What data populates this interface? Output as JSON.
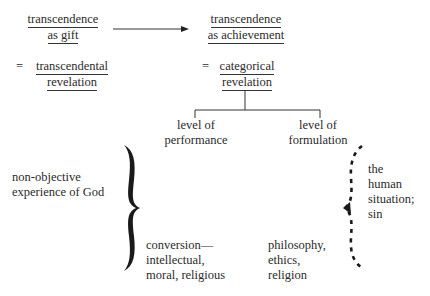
{
  "left_top": {
    "line1": "transcendence",
    "line2": "as gift"
  },
  "right_top": {
    "line1": "transcendence",
    "line2": "as achievement"
  },
  "left_eq": {
    "eq": "=",
    "line1": "transcendental",
    "line2": "revelation"
  },
  "right_eq": {
    "eq": "=",
    "line1": "categorical",
    "line2": "revelation"
  },
  "branches": {
    "performance": {
      "line1": "level of",
      "line2": "performance"
    },
    "formulation": {
      "line1": "level of",
      "line2": "formulation"
    }
  },
  "left_label": {
    "line1": "non-objective",
    "line2": "experience of God"
  },
  "bottom_performance": {
    "line1": "conversion—",
    "line2": "intellectual,",
    "line3": "moral, religious"
  },
  "bottom_formulation": {
    "line1": "philosophy,",
    "line2": "ethics,",
    "line3": "religion"
  },
  "right_label": {
    "line1": "the",
    "line2": "human",
    "line3": "situation;",
    "line4": "sin"
  },
  "colors": {
    "ink": "#2a2a2a",
    "background": "#ffffff"
  }
}
